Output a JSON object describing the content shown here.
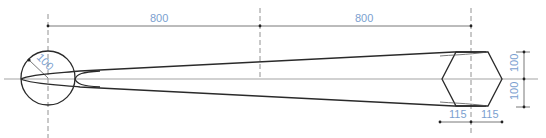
{
  "drawing": {
    "type": "tapered-beam-elevation",
    "colors": {
      "outline": "#2a2a2a",
      "dimension_text": "#7b9fd0",
      "centerline": "#777777"
    },
    "dimensions": {
      "left_span": "800",
      "right_span": "800",
      "circle_radius": "100",
      "hex_upper_height": "100",
      "hex_lower_height": "100",
      "hex_left_half_width": "115",
      "hex_right_half_width": "115"
    }
  }
}
